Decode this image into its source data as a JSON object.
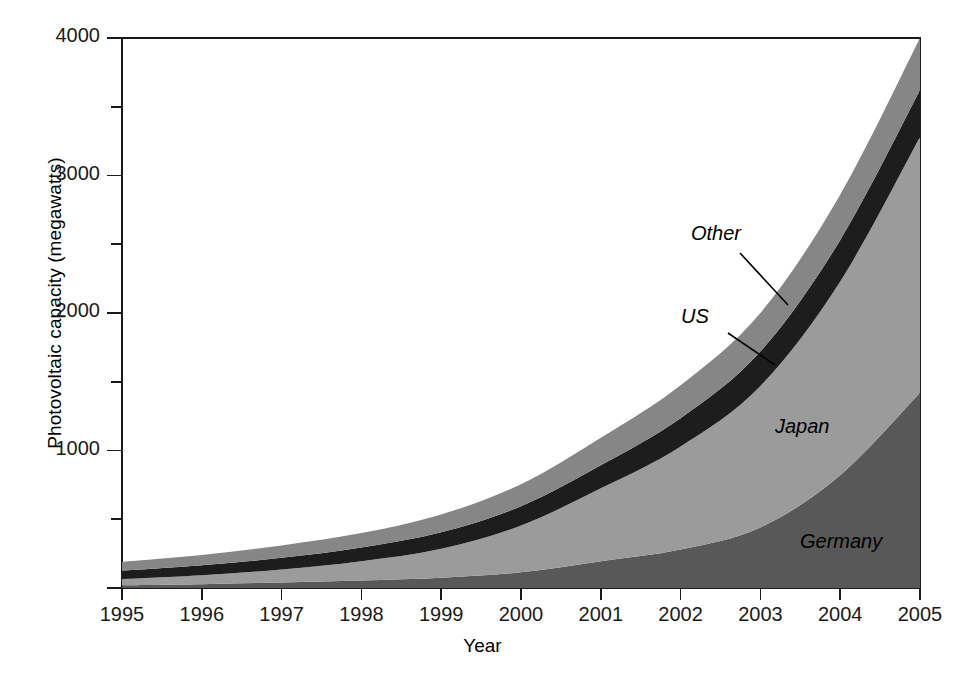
{
  "chart_data": {
    "type": "area",
    "stacked": true,
    "title": "",
    "xlabel": "Year",
    "ylabel": "Photovoltaic capacity (megawatts)",
    "x": [
      1995,
      1996,
      1997,
      1998,
      1999,
      2000,
      2001,
      2002,
      2003,
      2004,
      2005
    ],
    "xtick_labels": [
      "1995",
      "1996",
      "1997",
      "1998",
      "1999",
      "2000",
      "2001",
      "2002",
      "2003",
      "2004",
      "2005"
    ],
    "ytick_labels": [
      "0",
      "1000",
      "2000",
      "3000",
      "4000"
    ],
    "ytick_values": [
      0,
      1000,
      2000,
      3000,
      4000
    ],
    "yminor_values": [
      500,
      1500,
      2500,
      3500
    ],
    "ylim": [
      0,
      4000
    ],
    "xlim": [
      1995,
      2005
    ],
    "grid": false,
    "legend": "inline-annotations",
    "series": [
      {
        "name": "Germany",
        "color": "#585858",
        "values": [
          20,
          28,
          40,
          55,
          75,
          115,
          195,
          280,
          440,
          820,
          1420
        ]
      },
      {
        "name": "Japan",
        "color": "#9b9b9b",
        "values": [
          45,
          65,
          95,
          140,
          210,
          340,
          530,
          750,
          1030,
          1410,
          1860
        ]
      },
      {
        "name": "US",
        "color": "#1d1d1d",
        "values": [
          60,
          72,
          85,
          100,
          120,
          140,
          168,
          205,
          250,
          300,
          340
        ]
      },
      {
        "name": "Other",
        "color": "#868686",
        "values": [
          65,
          75,
          90,
          105,
          130,
          160,
          200,
          240,
          280,
          330,
          380
        ]
      }
    ],
    "stack_tops": {
      "Germany": [
        20,
        28,
        40,
        55,
        75,
        115,
        195,
        280,
        440,
        820,
        1420
      ],
      "Japan": [
        65,
        93,
        135,
        195,
        285,
        455,
        725,
        1030,
        1470,
        2230,
        3280
      ],
      "US": [
        125,
        165,
        220,
        295,
        405,
        595,
        893,
        1235,
        1720,
        2530,
        3620
      ],
      "Other": [
        190,
        240,
        310,
        400,
        535,
        755,
        1093,
        1475,
        2000,
        2860,
        4000
      ]
    },
    "totals": [
      190,
      240,
      310,
      400,
      535,
      755,
      1093,
      1475,
      2000,
      2860,
      4000
    ],
    "annotations": [
      {
        "label": "Other",
        "target_series": "Other",
        "leader": true
      },
      {
        "label": "US",
        "target_series": "US",
        "leader": true
      },
      {
        "label": "Japan",
        "target_series": "Japan",
        "leader": false
      },
      {
        "label": "Germany",
        "target_series": "Germany",
        "leader": false
      }
    ]
  },
  "axes": {
    "y_title": "Photovoltaic capacity (megawatts)",
    "x_title": "Year",
    "y_ticks": [
      {
        "label": "4000",
        "value": 4000
      },
      {
        "label": "3000",
        "value": 3000
      },
      {
        "label": "2000",
        "value": 2000
      },
      {
        "label": "1000",
        "value": 1000
      },
      {
        "label": "",
        "value": 0
      }
    ],
    "x_ticks": [
      {
        "label": "1995"
      },
      {
        "label": "1996"
      },
      {
        "label": "1997"
      },
      {
        "label": "1998"
      },
      {
        "label": "1999"
      },
      {
        "label": "2000"
      },
      {
        "label": "2001"
      },
      {
        "label": "2002"
      },
      {
        "label": "2003"
      },
      {
        "label": "2004"
      },
      {
        "label": "2005"
      }
    ]
  },
  "labels": {
    "other": "Other",
    "us": "US",
    "japan": "Japan",
    "germany": "Germany"
  },
  "colors": {
    "germany": "#585858",
    "japan": "#9b9b9b",
    "us": "#1d1d1d",
    "other": "#868686",
    "axis": "#1a1a1a",
    "background": "#ffffff"
  }
}
